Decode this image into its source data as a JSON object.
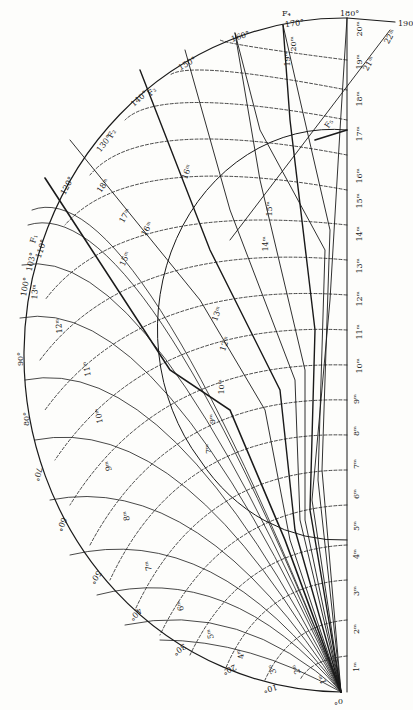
{
  "figure": {
    "type": "seismic-ray-path-travel-time-diagram",
    "origin_label": "0°",
    "ink_color": "#1a1a1a",
    "paper_color": "#fdfdfb",
    "distance_labels": [
      "10°",
      "20°",
      "30°",
      "40°",
      "50°",
      "60°",
      "70°",
      "80°",
      "90°",
      "100°",
      "103°",
      "110°",
      "120°",
      "130°",
      "140°",
      "150°",
      "160°",
      "170°",
      "180°",
      "190"
    ],
    "axis_time_labels": [
      "1ᵐ",
      "2ᵐ",
      "3ᵐ",
      "4ᵐ",
      "5ᵐ",
      "6ᵐ",
      "7ᵐ",
      "8ᵐ",
      "9ᵐ",
      "10ᵐ",
      "11ᵐ",
      "12ᵐ",
      "13ᵐ",
      "14ᵐ",
      "15ᵐ",
      "16ᵐ",
      "17ᵐ",
      "18ᵐ",
      "19ᵐ",
      "20ᵐ"
    ],
    "mantle_time_labels": [
      "1ᵐ",
      "2ᵐ",
      "3ᵐ",
      "4ᵐ",
      "5ᵐ",
      "6ᵐ",
      "7ᵐ",
      "8ᵐ",
      "9ᵐ",
      "10ᵐ",
      "11ᵐ",
      "12ᵐ",
      "13ᵐ"
    ],
    "upper_time_labels": [
      "15ᵐ",
      "16ᵐ",
      "17ᵐ",
      "18ᵐ",
      "19ᵐ",
      "20ᵐ",
      "21ᵐ",
      "22ᵐ"
    ],
    "core_time_labels": [
      "7ᵐ",
      "9ᵐ",
      "10ᵐ",
      "12ᵐ",
      "13ᵐ",
      "14ᵐ",
      "15ᵐ",
      "16ᵐ"
    ],
    "branch_labels": [
      "F₁",
      "F₂",
      "F₃",
      "F₄",
      "F₅"
    ]
  }
}
